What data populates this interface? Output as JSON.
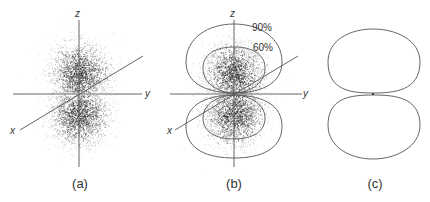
{
  "figure": {
    "panels": [
      {
        "id": "a",
        "caption": "(a)",
        "axes": {
          "z": "z",
          "y": "y",
          "x": "x"
        },
        "content": "electron density dot cloud (two lobes along z)"
      },
      {
        "id": "b",
        "caption": "(b)",
        "axes": {
          "z": "z",
          "y": "y",
          "x": "x"
        },
        "contours": [
          {
            "label": "90%",
            "probability": 90
          },
          {
            "label": "60%",
            "probability": 60
          }
        ],
        "content": "dot cloud with 90% and 60% probability boundary surfaces"
      },
      {
        "id": "c",
        "caption": "(c)",
        "content": "boundary surface outline (dumbbell shape)"
      }
    ],
    "colors": {
      "line": "#555555",
      "dots": "#222222",
      "text": "#333333"
    }
  }
}
